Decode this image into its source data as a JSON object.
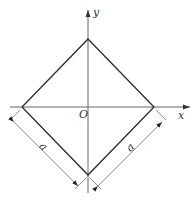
{
  "diagram": {
    "axes": {
      "x_label": "x",
      "y_label": "y",
      "origin_label": "O"
    },
    "shape": {
      "type": "square rotated 45°",
      "vertices": {
        "top": [
          88,
          39
        ],
        "right": [
          154,
          107
        ],
        "bottom": [
          88,
          175
        ],
        "left": [
          22,
          107
        ]
      }
    },
    "dimensions": [
      {
        "label": "a",
        "edge": "lower-left"
      },
      {
        "label": "a",
        "edge": "lower-right"
      }
    ],
    "colors": {
      "shape_stroke": "#2a2a2a",
      "axis_stroke": "#555555",
      "dim_stroke": "#666666",
      "background": "#ffffff"
    }
  }
}
